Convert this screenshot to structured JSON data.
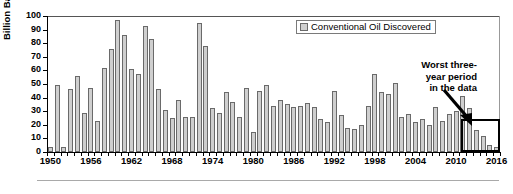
{
  "chart_data": {
    "type": "bar",
    "title": "",
    "xlabel": "",
    "ylabel": "Billion Barrels",
    "ylim": [
      0,
      100
    ],
    "ytick_values": [
      0,
      10,
      20,
      30,
      40,
      50,
      60,
      70,
      80,
      90,
      100
    ],
    "ytick_labels": [
      "0",
      "10",
      "20",
      "30",
      "40",
      "50",
      "60",
      "70",
      "80",
      "90",
      "100"
    ],
    "xtick_labels": [
      "1950",
      "1956",
      "1962",
      "1968",
      "1974",
      "1980",
      "1986",
      "1992",
      "1998",
      "2004",
      "2010",
      "2016"
    ],
    "grid": false,
    "legend_position": "top-right",
    "legend": [
      "Conventional Oil Discovered"
    ],
    "series_name": "Conventional Oil Discovered",
    "bar_color": "#cfcfcf",
    "bar_edge_color": "#6a6a6a",
    "categories": [
      "1950",
      "1951",
      "1952",
      "1953",
      "1954",
      "1955",
      "1956",
      "1957",
      "1958",
      "1959",
      "1960",
      "1961",
      "1962",
      "1963",
      "1964",
      "1965",
      "1966",
      "1967",
      "1968",
      "1969",
      "1970",
      "1971",
      "1972",
      "1973",
      "1974",
      "1975",
      "1976",
      "1977",
      "1978",
      "1979",
      "1980",
      "1981",
      "1982",
      "1983",
      "1984",
      "1985",
      "1986",
      "1987",
      "1988",
      "1989",
      "1990",
      "1991",
      "1992",
      "1993",
      "1994",
      "1995",
      "1996",
      "1997",
      "1998",
      "1999",
      "2000",
      "2001",
      "2002",
      "2003",
      "2004",
      "2005",
      "2006",
      "2007",
      "2008",
      "2009",
      "2010",
      "2011",
      "2012",
      "2013",
      "2014",
      "2015",
      "2016"
    ],
    "values": [
      4,
      49,
      4,
      46,
      56,
      29,
      47,
      23,
      62,
      76,
      97,
      86,
      61,
      57,
      93,
      83,
      46,
      31,
      25,
      38,
      26,
      26,
      95,
      78,
      32,
      29,
      44,
      37,
      26,
      47,
      15,
      45,
      49,
      34,
      38,
      35,
      33,
      34,
      36,
      33,
      24,
      22,
      45,
      27,
      18,
      17,
      20,
      34,
      57,
      44,
      43,
      51,
      26,
      28,
      22,
      24,
      20,
      33,
      23,
      28,
      30,
      41,
      32,
      16,
      12,
      5,
      4
    ],
    "annotations": [
      {
        "name": "worst-three-year-period",
        "text": "Worst three-year period in the data",
        "lines": [
          "Worst three-",
          "year period",
          "in the data"
        ],
        "highlight_categories": [
          "2014",
          "2015",
          "2016"
        ]
      }
    ]
  },
  "annotation": {
    "line1": "Worst three-",
    "line2": "year period",
    "line3": "in the data"
  },
  "legend": {
    "label": "Conventional Oil Discovered"
  },
  "axes": {
    "y_title": "Billion Barrels"
  }
}
